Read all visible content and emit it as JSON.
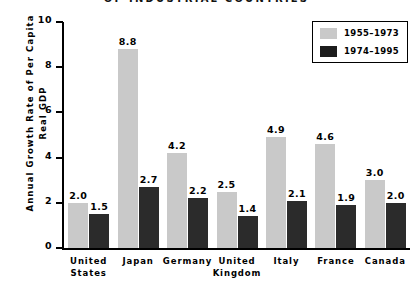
{
  "chart_data": {
    "type": "bar",
    "title": "OF INDUSTRIAL COUNTRIES",
    "xlabel": "",
    "ylabel_line1": "Annual Growth Rate of Per Capita",
    "ylabel_line2": "Real GDP",
    "ylim": [
      0,
      10
    ],
    "yticks": [
      0,
      2,
      4,
      6,
      8,
      10
    ],
    "ytick_labels": [
      "0",
      "2",
      "4",
      "6",
      "8",
      "10"
    ],
    "grid": false,
    "legend_position": "top-right",
    "categories": [
      {
        "lines": [
          "United",
          "States"
        ]
      },
      {
        "lines": [
          "Japan"
        ]
      },
      {
        "lines": [
          "Germany"
        ]
      },
      {
        "lines": [
          "United",
          "Kingdom"
        ]
      },
      {
        "lines": [
          "Italy"
        ]
      },
      {
        "lines": [
          "France"
        ]
      },
      {
        "lines": [
          "Canada"
        ]
      }
    ],
    "series": [
      {
        "name": "1955–1973",
        "color": "#c9c9c9",
        "values": [
          2.0,
          8.8,
          4.2,
          2.5,
          4.9,
          4.6,
          3.0
        ],
        "labels": [
          "2.0",
          "8.8",
          "4.2",
          "2.5",
          "4.9",
          "4.6",
          "3.0"
        ]
      },
      {
        "name": "1974–1995",
        "color": "#2b2b2b",
        "values": [
          1.5,
          2.7,
          2.2,
          1.4,
          2.1,
          1.9,
          2.0
        ],
        "labels": [
          "1.5",
          "2.7",
          "2.2",
          "1.4",
          "2.1",
          "1.9",
          "2.0"
        ]
      }
    ]
  },
  "legend": {
    "entries": [
      {
        "label": "1955–1973",
        "color": "#c9c9c9"
      },
      {
        "label": "1974–1995",
        "color": "#1c1c1c"
      }
    ]
  }
}
